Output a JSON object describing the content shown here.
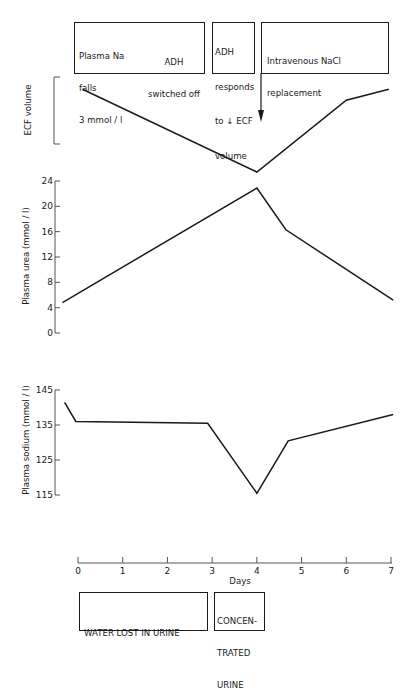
{
  "chart_data": [
    {
      "type": "line",
      "title": "",
      "ylabel": "ECF volume",
      "xlabel": "Days",
      "x": [
        0.1,
        4.0,
        6.0,
        6.95
      ],
      "values_relative": [
        0.9,
        0.0,
        0.78,
        0.9
      ],
      "note": "ECF volume plotted without numeric scale (bracket axis only)",
      "grid": false
    },
    {
      "type": "line",
      "title": "",
      "ylabel": "Plasma urea (mmol / l)",
      "xlabel": "Days",
      "yticks": [
        0,
        4,
        8,
        12,
        16,
        20,
        24
      ],
      "ylim": [
        0,
        24
      ],
      "x": [
        -0.35,
        4.0,
        4.65,
        7.05
      ],
      "values": [
        4.8,
        22.9,
        16.3,
        5.2
      ],
      "grid": false
    },
    {
      "type": "line",
      "title": "",
      "ylabel": "Plasma sodium (mmol / l)",
      "xlabel": "Days",
      "yticks": [
        115,
        125,
        135,
        145
      ],
      "ylim": [
        115,
        145
      ],
      "x": [
        -0.3,
        -0.05,
        2.9,
        4.0,
        4.7,
        7.05
      ],
      "values": [
        141.5,
        136,
        135.5,
        115.5,
        130.5,
        138
      ],
      "grid": false
    }
  ],
  "xaxis": {
    "label": "Days",
    "ticks": [
      "0",
      "1",
      "2",
      "3",
      "4",
      "5",
      "6",
      "7"
    ]
  },
  "top_boxes": [
    {
      "lines_left": [
        "Plasma Na",
        "falls",
        "3 mmol / l"
      ],
      "lines_right": [
        "ADH",
        "switched off"
      ]
    },
    {
      "lines": [
        "ADH",
        "responds",
        "to ↓ ECF",
        "volume"
      ]
    },
    {
      "lines": [
        "Intravenous NaCl",
        "replacement"
      ]
    }
  ],
  "bottom_boxes": [
    {
      "lines": [
        "WATER LOST IN URINE"
      ]
    },
    {
      "lines": [
        "CONCEN-",
        "TRATED",
        "URINE"
      ]
    }
  ],
  "colors": {
    "ink": "#1a1a1a",
    "background": "#ffffff"
  }
}
